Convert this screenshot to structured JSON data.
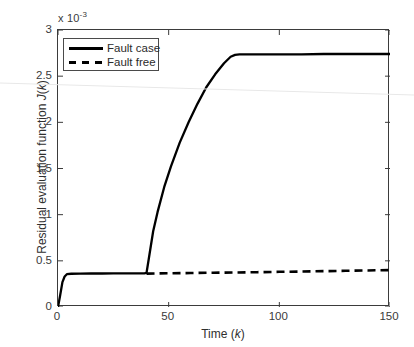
{
  "chart_data": {
    "type": "line",
    "title": "",
    "xlabel": "Time (k)",
    "ylabel": "Residual evaluation function J(k)",
    "y_axis_multiplier": "x 10",
    "y_axis_exponent": "-3",
    "xlim": [
      0,
      150
    ],
    "ylim": [
      0,
      3
    ],
    "xticks": [
      0,
      50,
      100,
      150
    ],
    "xtick_labels": [
      "0",
      "50",
      "100",
      "150"
    ],
    "yticks": [
      0,
      0.5,
      1,
      1.5,
      2,
      2.5,
      3
    ],
    "ytick_labels": [
      "0",
      "0.5",
      "1",
      "1.5",
      "2",
      "2.5",
      "3"
    ],
    "grid": false,
    "legend_position": "upper left",
    "series": [
      {
        "name": "Fault case",
        "style": "solid",
        "color": "#000000",
        "x": [
          0,
          1,
          2,
          3,
          4,
          6,
          10,
          15,
          20,
          25,
          30,
          35,
          39,
          40,
          41,
          43,
          45,
          48,
          51,
          55,
          59,
          63,
          67,
          71,
          75,
          78,
          80,
          82,
          90,
          100,
          110,
          120,
          130,
          140,
          150
        ],
        "y": [
          0.0,
          0.13,
          0.27,
          0.33,
          0.355,
          0.36,
          0.362,
          0.363,
          0.363,
          0.364,
          0.364,
          0.365,
          0.365,
          0.37,
          0.52,
          0.82,
          1.03,
          1.3,
          1.52,
          1.78,
          2.0,
          2.2,
          2.38,
          2.52,
          2.64,
          2.71,
          2.73,
          2.735,
          2.735,
          2.735,
          2.735,
          2.74,
          2.74,
          2.74,
          2.74
        ]
      },
      {
        "name": "Fault free",
        "style": "dashed",
        "color": "#000000",
        "x": [
          40,
          50,
          60,
          70,
          80,
          90,
          100,
          110,
          120,
          130,
          140,
          150
        ],
        "y": [
          0.362,
          0.365,
          0.368,
          0.371,
          0.374,
          0.377,
          0.381,
          0.384,
          0.388,
          0.392,
          0.396,
          0.4
        ]
      }
    ],
    "legend_entries": [
      {
        "label": "Fault case",
        "style": "solid"
      },
      {
        "label": "Fault free",
        "style": "dashed"
      }
    ],
    "annotations": []
  }
}
